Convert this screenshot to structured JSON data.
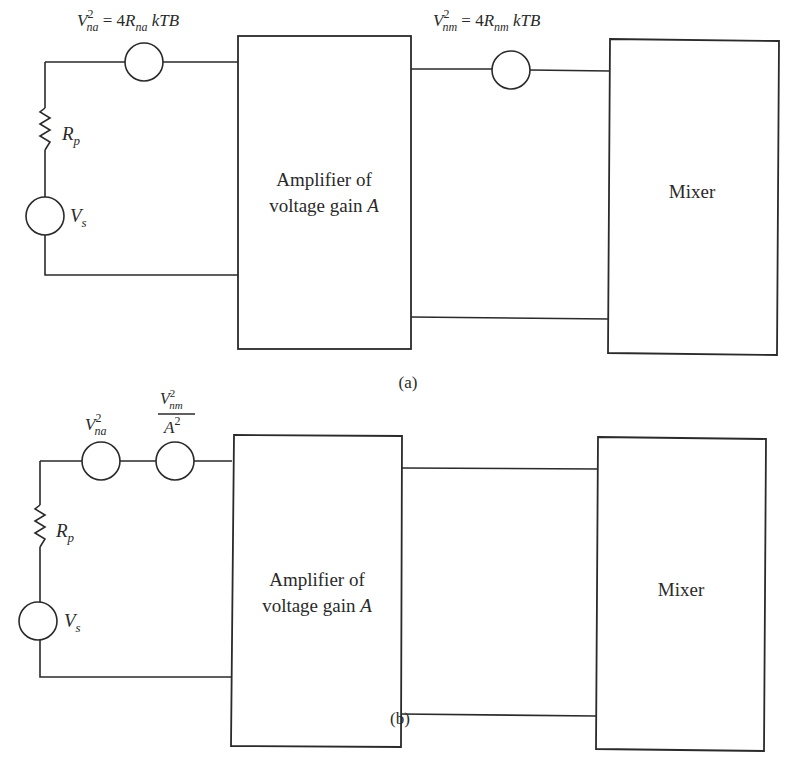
{
  "diagram_a": {
    "caption": "(a)",
    "source": {
      "symbol": "V",
      "subscript": "s"
    },
    "resistor": {
      "symbol": "R",
      "subscript": "p"
    },
    "noise_source_amp": {
      "lhs_symbol": "V",
      "lhs_sub": "na",
      "lhs_sup": "2",
      "eq": " = 4",
      "rhs_symbol": "R",
      "rhs_sub": "na",
      "rhs_tail": " kTB"
    },
    "noise_source_mixer": {
      "lhs_symbol": "V",
      "lhs_sub": "nm",
      "lhs_sup": "2",
      "eq": " = 4",
      "rhs_symbol": "R",
      "rhs_sub": "nm",
      "rhs_tail": " kTB"
    },
    "amplifier": {
      "line1": "Amplifier of",
      "line2": "voltage gain ",
      "gain_symbol": "A"
    },
    "mixer": {
      "label": "Mixer"
    }
  },
  "diagram_b": {
    "caption": "(b)",
    "source": {
      "symbol": "V",
      "subscript": "s"
    },
    "resistor": {
      "symbol": "R",
      "subscript": "p"
    },
    "noise_source_amp": {
      "symbol": "V",
      "sub": "na",
      "sup": "2"
    },
    "noise_source_mixer_referred": {
      "num_symbol": "V",
      "num_sub": "nm",
      "num_sup": "2",
      "den_symbol": "A",
      "den_sup": "2"
    },
    "amplifier": {
      "line1": "Amplifier of",
      "line2": "voltage gain ",
      "gain_symbol": "A"
    },
    "mixer": {
      "label": "Mixer"
    }
  }
}
